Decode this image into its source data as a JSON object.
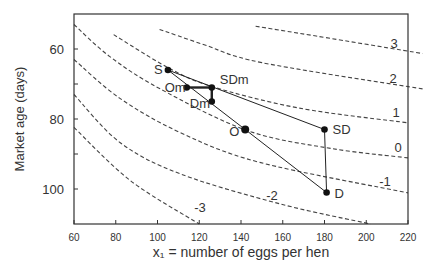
{
  "chart_data": {
    "type": "line",
    "title": "",
    "xlabel": "x₁ = number of eggs per hen",
    "ylabel": "Market age (days)",
    "xlim": [
      60,
      220
    ],
    "ylim": [
      110,
      50
    ],
    "y_inverted": true,
    "x_ticks": [
      60,
      80,
      100,
      120,
      140,
      160,
      180,
      200,
      220
    ],
    "y_ticks": [
      60,
      70,
      80,
      90,
      100
    ],
    "y_tick_labels": [
      "60",
      "",
      "80",
      "",
      "100"
    ],
    "grid": false,
    "legend": null,
    "contours": [
      {
        "label": "3",
        "style": "dashed",
        "points": [
          [
            147,
            53.5
          ],
          [
            176,
            56.3
          ],
          [
            227,
            61.3
          ]
        ]
      },
      {
        "label": "2",
        "style": "dashed",
        "points": [
          [
            101,
            54.4
          ],
          [
            122,
            58.7
          ],
          [
            150,
            63.9
          ],
          [
            227,
            71.4
          ]
        ]
      },
      {
        "label": "1",
        "style": "dashed",
        "points": [
          [
            79,
            55.9
          ],
          [
            105,
            65.3
          ],
          [
            126,
            70.7
          ],
          [
            168,
            76.9
          ],
          [
            220,
            81.1
          ]
        ]
      },
      {
        "label": "0",
        "style": "dashed",
        "points": [
          [
            60,
            53
          ],
          [
            77,
            62.1
          ],
          [
            101,
            71.3
          ],
          [
            143,
            83.3
          ],
          [
            183,
            88.4
          ],
          [
            220,
            91.1
          ]
        ]
      },
      {
        "label": "-1",
        "style": "dashed",
        "points": [
          [
            60,
            63
          ],
          [
            82,
            74.1
          ],
          [
            111,
            83.9
          ],
          [
            149,
            92.4
          ],
          [
            220,
            101.1
          ]
        ]
      },
      {
        "label": "-2",
        "style": "dashed",
        "points": [
          [
            60,
            73
          ],
          [
            82,
            86.7
          ],
          [
            111,
            95.7
          ],
          [
            159,
            104.3
          ],
          [
            202,
            110
          ]
        ]
      },
      {
        "label": "-3",
        "style": "dashed",
        "points": [
          [
            60,
            82.4
          ],
          [
            87,
            97.6
          ],
          [
            120,
            110
          ]
        ]
      }
    ],
    "points": [
      {
        "label": "S",
        "x": 105,
        "y": 66
      },
      {
        "label": "Om",
        "x": 114,
        "y": 71
      },
      {
        "label": "SDm",
        "x": 126,
        "y": 71
      },
      {
        "label": "Dm",
        "x": 126,
        "y": 75
      },
      {
        "label": "O",
        "x": 142,
        "y": 83
      },
      {
        "label": "SD",
        "x": 180,
        "y": 83
      },
      {
        "label": "D",
        "x": 181,
        "y": 101
      }
    ],
    "segments": [
      {
        "from": "S",
        "to": "SD",
        "weight": "thin"
      },
      {
        "from": "S",
        "to": "O",
        "weight": "thin"
      },
      {
        "from": "Om",
        "to": "SDm",
        "weight": "thick"
      },
      {
        "from": "SDm",
        "to": "Dm",
        "weight": "thick"
      },
      {
        "from": "O",
        "to": "D",
        "weight": "thin"
      },
      {
        "from": "SD",
        "to": "D",
        "weight": "thin"
      }
    ]
  }
}
